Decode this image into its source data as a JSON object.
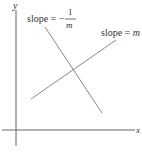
{
  "diagram": {
    "axes": {
      "x_label": "x",
      "y_label": "y",
      "color": "#555555"
    },
    "lines": [
      {
        "name": "perpendicular-line",
        "label_prefix": "slope = −",
        "label_numerator": "1",
        "label_denominator": "m",
        "color": "#888888"
      },
      {
        "name": "main-line",
        "label_prefix": "slope = ",
        "label_var": "m",
        "color": "#888888"
      }
    ]
  }
}
